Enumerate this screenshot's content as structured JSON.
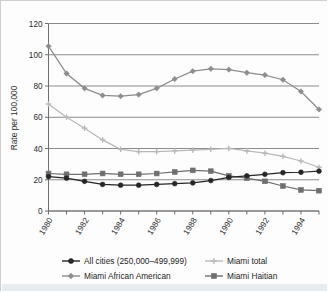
{
  "chart_data": {
    "type": "line",
    "title": "",
    "xlabel": "",
    "ylabel": "Rate per 100,000",
    "xlim": [
      1980,
      1995
    ],
    "ylim": [
      0,
      120
    ],
    "yticks": [
      0,
      20,
      40,
      60,
      80,
      100,
      120
    ],
    "ytick_labels": [
      "0",
      "20",
      "40",
      "60",
      "80",
      "100",
      "120"
    ],
    "x": [
      1980,
      1981,
      1982,
      1983,
      1984,
      1985,
      1986,
      1987,
      1988,
      1989,
      1990,
      1991,
      1992,
      1993,
      1994,
      1995
    ],
    "xtick_labels": [
      "1980",
      "1982",
      "1984",
      "1986",
      "1988",
      "1990",
      "1992",
      "1994"
    ],
    "xticks": [
      1980,
      1982,
      1984,
      1986,
      1988,
      1990,
      1992,
      1994
    ],
    "grid": "horizontal",
    "legend_position": "bottom",
    "series": [
      {
        "name": "All cities (250,000–499,999)",
        "color": "#262626",
        "marker": "circle",
        "values": [
          22,
          21,
          19,
          17,
          16.5,
          16.5,
          17,
          17.5,
          18,
          19.5,
          21.5,
          22.5,
          23.5,
          24.5,
          24.8,
          25.5
        ]
      },
      {
        "name": "Miami total",
        "color": "#b9b9b9",
        "marker": "cross",
        "values": [
          68.5,
          60,
          53,
          45.5,
          39.5,
          38,
          38,
          38.5,
          39,
          39.5,
          40,
          38.5,
          37,
          35,
          32,
          28
        ]
      },
      {
        "name": "Miami African American",
        "color": "#8d8d8d",
        "marker": "diamond",
        "values": [
          105.5,
          88,
          78.5,
          74,
          73.5,
          74.5,
          78.5,
          84.5,
          89.5,
          91,
          90.5,
          88.5,
          87,
          84,
          76.5,
          65
        ]
      },
      {
        "name": "Miami Haitian",
        "color": "#6f6f6f",
        "marker": "square",
        "values": [
          24,
          23.5,
          23.5,
          24,
          23.5,
          23.5,
          24,
          25,
          26,
          25.5,
          22.5,
          21,
          19,
          16,
          13.5,
          13
        ]
      }
    ]
  },
  "legend": {
    "entries": [
      {
        "label": "All cities (250,000–499,999)",
        "series_index": 0
      },
      {
        "label": "Miami total",
        "series_index": 1
      },
      {
        "label": "Miami African American",
        "series_index": 2
      },
      {
        "label": "Miami Haitian",
        "series_index": 3
      }
    ]
  },
  "axes": {
    "y_axis_title": "Rate per 100,000"
  }
}
